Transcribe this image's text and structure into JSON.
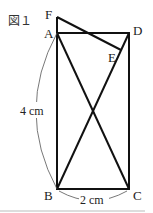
{
  "figure": {
    "caption": "図１",
    "points": {
      "A": "A",
      "B": "B",
      "C": "C",
      "D": "D",
      "E": "E",
      "F": "F"
    },
    "dimensions": {
      "height": "4 cm",
      "width": "2 cm"
    }
  }
}
